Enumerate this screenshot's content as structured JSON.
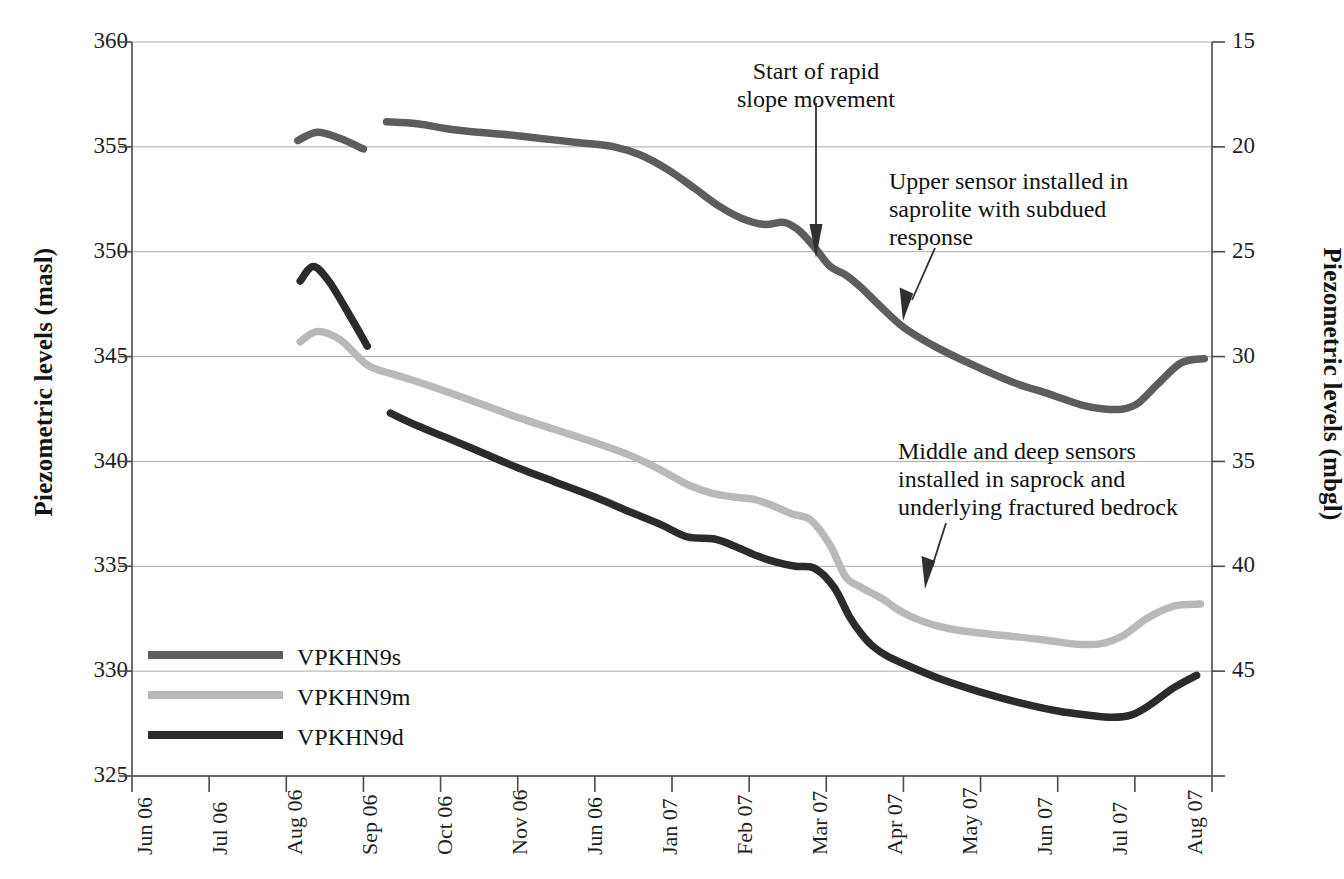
{
  "chart_data": {
    "type": "line",
    "title": "",
    "xlabel": "",
    "ylabel": "Piezometric levels (masl)",
    "ylabel_right": "Piezometric levels (mbgl)",
    "ylim": [
      325,
      360
    ],
    "ylim_right": [
      45,
      15
    ],
    "yticks": [
      "325",
      "330",
      "335",
      "340",
      "345",
      "350",
      "355",
      "360"
    ],
    "yticks_right": [
      "15",
      "20",
      "25",
      "30",
      "35",
      "40",
      "45"
    ],
    "grid": true,
    "legend_position": "lower-left-inside",
    "categories": [
      "Jun 06",
      "Jul 06",
      "Aug 06",
      "Sep 06",
      "Oct 06",
      "Nov 06",
      "Jun 06",
      "Jan 07",
      "Feb 07",
      "Mar 07",
      "Apr 07",
      "May 07",
      "Jun 07",
      "Jul 07",
      "Aug 07"
    ],
    "series": [
      {
        "name": "VPKHN9s",
        "color": "#5d5d5d",
        "segments": [
          {
            "x": [
              2.15,
              2.4,
              2.7,
              3.0
            ],
            "y": [
              355.3,
              355.7,
              355.4,
              354.9
            ]
          },
          {
            "x": [
              3.3,
              3.7,
              4.2,
              4.8,
              5.3,
              5.8,
              6.25,
              6.6,
              6.95,
              7.3,
              7.6,
              7.9,
              8.2,
              8.45,
              8.65,
              8.85,
              9.05,
              9.25,
              9.45,
              9.7,
              10.0,
              10.4,
              10.9,
              11.4,
              11.9,
              12.3,
              12.6,
              12.85,
              13.05,
              13.3,
              13.6,
              13.9
            ],
            "y": [
              356.2,
              356.1,
              355.8,
              355.6,
              355.4,
              355.2,
              355.0,
              354.6,
              353.9,
              353.0,
              352.2,
              351.6,
              351.3,
              351.4,
              351.0,
              350.2,
              349.3,
              348.9,
              348.3,
              347.4,
              346.4,
              345.5,
              344.6,
              343.8,
              343.2,
              342.7,
              342.5,
              342.5,
              342.8,
              343.7,
              344.7,
              344.9
            ]
          }
        ]
      },
      {
        "name": "VPKHN9m",
        "color": "#b9b9b9",
        "segments": [
          {
            "x": [
              2.18,
              2.4,
              2.7,
              3.05,
              3.35,
              3.7,
              4.1,
              4.55,
              5.0,
              5.5,
              6.0,
              6.45,
              6.85,
              7.2,
              7.5,
              7.8,
              8.05,
              8.3,
              8.55,
              8.8,
              9.05,
              9.25,
              9.45,
              9.6,
              9.75,
              9.9,
              10.1,
              10.4,
              10.8,
              11.3,
              11.8,
              12.2,
              12.55,
              12.85,
              13.15,
              13.5,
              13.85
            ],
            "y": [
              345.7,
              346.2,
              345.8,
              344.6,
              344.2,
              343.8,
              343.3,
              342.7,
              342.1,
              341.5,
              340.9,
              340.3,
              339.6,
              338.9,
              338.5,
              338.3,
              338.2,
              337.9,
              337.5,
              337.2,
              336.0,
              334.5,
              334.0,
              333.7,
              333.4,
              333.0,
              332.6,
              332.2,
              331.9,
              331.7,
              331.5,
              331.3,
              331.3,
              331.7,
              332.5,
              333.1,
              333.2
            ]
          }
        ]
      },
      {
        "name": "VPKHN9d",
        "color": "#2b2b2b",
        "segments": [
          {
            "x": [
              2.18,
              2.35,
              2.55,
              2.8,
              3.05
            ],
            "y": [
              348.6,
              349.3,
              348.6,
              347.1,
              345.5
            ]
          },
          {
            "x": [
              3.35,
              3.7,
              4.1,
              4.55,
              5.0,
              5.5,
              6.0,
              6.45,
              6.85,
              7.2,
              7.55,
              7.85,
              8.1,
              8.35,
              8.6,
              8.85,
              9.1,
              9.3,
              9.45,
              9.6,
              9.8,
              10.1,
              10.5,
              11.0,
              11.5,
              12.0,
              12.4,
              12.7,
              12.95,
              13.2,
              13.5,
              13.8
            ],
            "y": [
              342.3,
              341.7,
              341.1,
              340.4,
              339.7,
              339.0,
              338.3,
              337.6,
              337.0,
              336.4,
              336.3,
              335.9,
              335.5,
              335.2,
              335.0,
              334.9,
              334.0,
              332.6,
              331.8,
              331.2,
              330.7,
              330.2,
              329.6,
              329.0,
              328.5,
              328.1,
              327.9,
              327.8,
              327.9,
              328.4,
              329.2,
              329.8
            ]
          }
        ]
      }
    ],
    "annotations": [
      {
        "id": "start",
        "text": "Start of rapid\nslope movement",
        "arrow": "down"
      },
      {
        "id": "upper",
        "text": "Upper sensor installed in\nsaprolite with subdued\nresponse",
        "arrow": "diagonal-down-left"
      },
      {
        "id": "middle",
        "text": "Middle and deep sensors\ninstalled in saprock and\nunderlying fractured bedrock",
        "arrow": "diagonal-down-left"
      }
    ]
  },
  "legend": {
    "items": [
      {
        "label": "VPKHN9s",
        "color": "#5d5d5d"
      },
      {
        "label": "VPKHN9m",
        "color": "#b9b9b9"
      },
      {
        "label": "VPKHN9d",
        "color": "#2b2b2b"
      }
    ]
  },
  "colors": {
    "axis": "#4a4a4a",
    "grid": "#9a9a9a",
    "text": "#141414",
    "background": "#ffffff"
  }
}
